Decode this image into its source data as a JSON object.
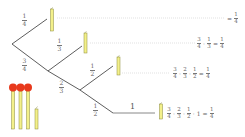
{
  "diagram": {
    "type": "probability-tree",
    "colors": {
      "branch_line": "#333333",
      "last_branch_line": "#888888",
      "dotted_guide": "#cccccc",
      "match_stick_fill": "#f3f08a",
      "match_stick_stroke": "#8a8a3a",
      "match_head": "#e8391c"
    },
    "branches": [
      {
        "label_num": "1",
        "label_den": "4"
      },
      {
        "label_num": "3",
        "label_den": "4"
      },
      {
        "label_num": "1",
        "label_den": "3"
      },
      {
        "label_num": "2",
        "label_den": "3"
      },
      {
        "label_num": "1",
        "label_den": "2"
      },
      {
        "label_num": "1",
        "label_den": "2"
      },
      {
        "label_whole": "1"
      }
    ],
    "results": [
      {
        "terms": [],
        "eq": "=",
        "result_num": "1",
        "result_den": "4"
      },
      {
        "terms": [
          {
            "n": "3",
            "d": "4"
          },
          {
            "n": "1",
            "d": "3"
          }
        ],
        "op": "·",
        "eq": "=",
        "result_num": "1",
        "result_den": "4"
      },
      {
        "terms": [
          {
            "n": "3",
            "d": "4"
          },
          {
            "n": "2",
            "d": "3"
          },
          {
            "n": "1",
            "d": "2"
          }
        ],
        "op": "·",
        "eq": "=",
        "result_num": "1",
        "result_den": "4"
      },
      {
        "terms": [
          {
            "n": "3",
            "d": "4"
          },
          {
            "n": "2",
            "d": "3"
          },
          {
            "n": "1",
            "d": "2"
          }
        ],
        "whole": "1",
        "op": "·",
        "eq": "=",
        "result_num": "1",
        "result_den": "4"
      }
    ],
    "matches": {
      "full_count": 3,
      "broken_count": 1
    }
  }
}
